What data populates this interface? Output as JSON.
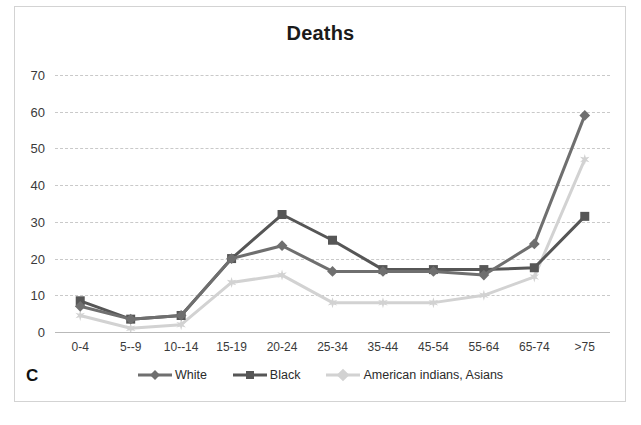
{
  "figure": {
    "panel_label": "C",
    "title": "Deaths"
  },
  "chart_data": {
    "type": "line",
    "title": "Deaths",
    "xlabel": "",
    "ylabel": "",
    "ylim": [
      0,
      70
    ],
    "yticks": [
      0,
      10,
      20,
      30,
      40,
      50,
      60,
      70
    ],
    "ytick_labels": [
      "0",
      "10",
      "20",
      "30",
      "40",
      "50",
      "60",
      "70"
    ],
    "grid": true,
    "legend_position": "bottom",
    "categories": [
      "0-4",
      "5--9",
      "10--14",
      "15-19",
      "20-24",
      "25-34",
      "35-44",
      "45-54",
      "55-64",
      "65-74",
      ">75"
    ],
    "series": [
      {
        "name": "White",
        "color": "#6f6f6f",
        "marker": "diamond",
        "values": [
          7,
          3.5,
          4.5,
          20,
          23.5,
          16.5,
          16.5,
          16.5,
          15.5,
          24,
          59
        ]
      },
      {
        "name": "Black",
        "color": "#565656",
        "marker": "square",
        "values": [
          8.5,
          3.5,
          4.5,
          20,
          32,
          25,
          17,
          17,
          17,
          17.5,
          31.5
        ]
      },
      {
        "name": "American indians, Asians",
        "color": "#d2d2d2",
        "marker": "star",
        "values": [
          4.5,
          1,
          2,
          13.5,
          15.5,
          8,
          8,
          8,
          10,
          15,
          47
        ]
      }
    ]
  },
  "colors": {
    "frame_border": "#d3d3d3",
    "gridline": "#c9c9c9",
    "axis_text": "#3a3a3a",
    "title_text": "#1a1a1a"
  }
}
